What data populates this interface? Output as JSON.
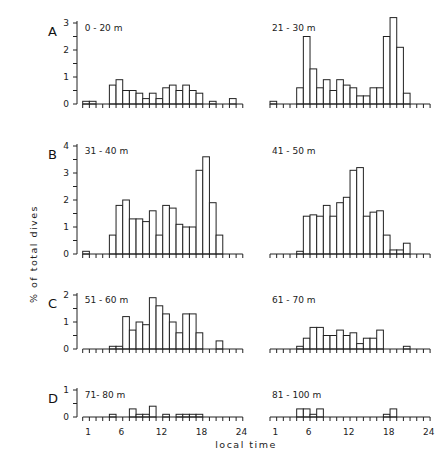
{
  "chart_data": {
    "type": "bar",
    "title": "",
    "xlabel": "local time",
    "ylabel": "% of total dives",
    "x_ticks": [
      1,
      6,
      12,
      18,
      24
    ],
    "bins": [
      1,
      2,
      3,
      4,
      5,
      6,
      7,
      8,
      9,
      10,
      11,
      12,
      13,
      14,
      15,
      16,
      17,
      18,
      19,
      20,
      21,
      22,
      23,
      24
    ],
    "rows": [
      {
        "letter": "A",
        "ylim": [
          0,
          3
        ],
        "y_ticks": [
          0,
          1,
          2,
          3
        ]
      },
      {
        "letter": "B",
        "ylim": [
          0,
          4
        ],
        "y_ticks": [
          0,
          1,
          2,
          3,
          4
        ]
      },
      {
        "letter": "C",
        "ylim": [
          0,
          2
        ],
        "y_ticks": [
          0,
          1,
          2
        ]
      },
      {
        "letter": "D",
        "ylim": [
          0,
          1
        ],
        "y_ticks": [
          0,
          1
        ]
      }
    ],
    "panels": [
      {
        "row": 0,
        "col": 0,
        "label": "0 - 20  m",
        "values": [
          0.1,
          0.1,
          0,
          0,
          0.7,
          0.9,
          0.5,
          0.5,
          0.4,
          0.2,
          0.4,
          0.2,
          0.6,
          0.7,
          0.5,
          0.7,
          0.5,
          0.4,
          0,
          0.1,
          0,
          0,
          0.2,
          0
        ]
      },
      {
        "row": 0,
        "col": 1,
        "label": "21 - 30  m",
        "values": [
          0.1,
          0,
          0,
          0,
          0.6,
          2.5,
          1.3,
          0.6,
          0.9,
          0.5,
          0.9,
          0.7,
          0.6,
          0.3,
          0.3,
          0.6,
          0.6,
          2.5,
          3.2,
          2.1,
          0.4,
          0,
          0,
          0
        ]
      },
      {
        "row": 1,
        "col": 0,
        "label": "31 - 40  m",
        "values": [
          0.1,
          0,
          0,
          0,
          0.7,
          1.8,
          2.0,
          1.3,
          1.3,
          1.2,
          1.6,
          0.7,
          1.8,
          1.7,
          1.1,
          1.0,
          1.0,
          3.1,
          3.6,
          1.9,
          0.7,
          0,
          0,
          0
        ]
      },
      {
        "row": 1,
        "col": 1,
        "label": "41 - 50  m",
        "values": [
          0,
          0,
          0,
          0,
          0.1,
          1.4,
          1.45,
          1.4,
          1.8,
          1.4,
          1.9,
          2.1,
          3.1,
          3.2,
          1.4,
          1.55,
          1.6,
          0.7,
          0.15,
          0.15,
          0.4,
          0,
          0,
          0
        ]
      },
      {
        "row": 2,
        "col": 0,
        "label": "51 - 60  m",
        "values": [
          0,
          0,
          0,
          0,
          0.1,
          0.1,
          1.2,
          0.7,
          1.0,
          0.9,
          1.9,
          1.6,
          1.3,
          1.0,
          0.6,
          1.3,
          1.3,
          0.6,
          0,
          0,
          0.3,
          0,
          0,
          0
        ]
      },
      {
        "row": 2,
        "col": 1,
        "label": "61 - 70  m",
        "values": [
          0,
          0,
          0,
          0,
          0.1,
          0.4,
          0.8,
          0.8,
          0.5,
          0.5,
          0.7,
          0.5,
          0.6,
          0.2,
          0.4,
          0.4,
          0.7,
          0,
          0,
          0,
          0.1,
          0,
          0,
          0
        ]
      },
      {
        "row": 3,
        "col": 0,
        "label": "71- 80  m",
        "values": [
          0,
          0,
          0,
          0,
          0.1,
          0,
          0,
          0.3,
          0.1,
          0.1,
          0.4,
          0,
          0.1,
          0,
          0.1,
          0.1,
          0.1,
          0.1,
          0,
          0,
          0,
          0,
          0,
          0
        ]
      },
      {
        "row": 3,
        "col": 1,
        "label": "81 - 100  m",
        "values": [
          0,
          0,
          0,
          0,
          0.3,
          0.3,
          0.1,
          0.3,
          0,
          0,
          0,
          0,
          0,
          0,
          0,
          0,
          0,
          0.1,
          0.3,
          0,
          0,
          0,
          0,
          0,
          0
        ]
      }
    ]
  },
  "figure": {
    "row_letters": [
      "A",
      "B",
      "C",
      "D"
    ],
    "ylabel": "% of total dives",
    "xlabel": "local time"
  }
}
